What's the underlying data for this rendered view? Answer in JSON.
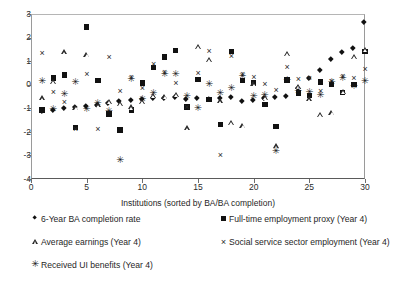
{
  "chart_data": {
    "type": "scatter",
    "title": "",
    "xlabel": "Institutions (sorted by BA/BA completion)",
    "ylabel": "",
    "xlim": [
      0,
      30
    ],
    "ylim": [
      -4,
      3
    ],
    "xticks": [
      0,
      5,
      10,
      15,
      20,
      25,
      30
    ],
    "yticks": [
      3,
      2,
      1,
      0,
      -1,
      -2,
      -3,
      -4
    ],
    "grid": false,
    "legend_position": "below-plot",
    "series": [
      {
        "name": "6-Year BA completion rate",
        "marker": "filled-diamond",
        "marker_glyph": "◆",
        "color": "#111111",
        "x": [
          1,
          2,
          3,
          4,
          5,
          6,
          7,
          8,
          9,
          10,
          11,
          12,
          13,
          14,
          15,
          16,
          17,
          18,
          19,
          20,
          21,
          22,
          23,
          24,
          25,
          26,
          27,
          28,
          29,
          30
        ],
        "y": [
          -1.12,
          -1.08,
          -1.0,
          -0.97,
          -0.92,
          -0.88,
          -0.82,
          -0.72,
          -0.68,
          -0.62,
          -0.58,
          -0.57,
          -0.55,
          -0.62,
          -0.6,
          -0.62,
          -0.58,
          -0.55,
          -0.72,
          -0.68,
          -0.6,
          -0.55,
          -0.5,
          -0.18,
          0.28,
          0.62,
          1.08,
          1.35,
          1.52,
          2.62
        ]
      },
      {
        "name": "Full-time employment proxy (Year 4)",
        "marker": "filled-square",
        "marker_glyph": "■",
        "color": "#111111",
        "x": [
          1,
          2,
          3,
          4,
          5,
          6,
          7,
          8,
          9,
          10,
          11,
          12,
          13,
          14,
          15,
          16,
          17,
          18,
          19,
          20,
          21,
          22,
          23,
          24,
          25,
          26,
          27,
          28,
          29,
          30
        ],
        "y": [
          -1.08,
          0.28,
          0.42,
          -1.82,
          2.45,
          0.18,
          -1.25,
          -1.92,
          -1.08,
          0.08,
          0.72,
          1.18,
          1.45,
          -0.95,
          0.22,
          -0.62,
          -1.68,
          1.42,
          0.18,
          0.08,
          -0.85,
          -1.78,
          0.2,
          -0.35,
          -0.45,
          0.12,
          0.02,
          -0.32,
          0.02,
          1.42
        ]
      },
      {
        "name": "Average earnings (Year 4)",
        "marker": "open-triangle",
        "marker_glyph": "△",
        "color": "#2b2b2b",
        "x": [
          1,
          2,
          3,
          4,
          5,
          6,
          7,
          8,
          9,
          10,
          11,
          12,
          13,
          14,
          15,
          16,
          17,
          18,
          19,
          20,
          21,
          22,
          23,
          24,
          25,
          26,
          27,
          28,
          29,
          30
        ],
        "y": [
          -0.58,
          0.12,
          1.38,
          -0.98,
          1.28,
          -0.88,
          -0.72,
          -0.82,
          -0.95,
          -0.72,
          -0.48,
          -0.52,
          -0.42,
          -1.85,
          1.62,
          1.05,
          -0.7,
          -1.62,
          -1.75,
          0.02,
          -0.55,
          -2.62,
          1.32,
          -0.08,
          -0.62,
          -1.28,
          -1.18,
          -0.3,
          1.18,
          1.48
        ]
      },
      {
        "name": "Social service sector employment (Year 4)",
        "marker": "thin-cross",
        "marker_glyph": "×",
        "color": "#2a2a2a",
        "x": [
          1,
          2,
          3,
          4,
          5,
          6,
          7,
          8,
          9,
          10,
          11,
          12,
          13,
          14,
          15,
          16,
          17,
          18,
          19,
          20,
          21,
          22,
          23,
          24,
          25,
          26,
          27,
          28,
          29,
          30
        ],
        "y": [
          1.28,
          -0.38,
          -0.78,
          -1.92,
          0.38,
          -1.95,
          1.12,
          -0.32,
          0.28,
          -0.18,
          0.82,
          0.48,
          0.02,
          -1.02,
          0.42,
          1.38,
          -3.02,
          1.18,
          0.38,
          0.25,
          -0.02,
          -0.28,
          0.68,
          0.18,
          0.22,
          -0.32,
          0.08,
          0.32,
          0.22,
          0.62
        ]
      },
      {
        "name": "Received UI benefits (Year 4)",
        "marker": "bold-star",
        "marker_glyph": "✳",
        "color": "#151515",
        "x": [
          1,
          2,
          3,
          4,
          5,
          6,
          7,
          8,
          9,
          10,
          11,
          12,
          13,
          14,
          15,
          16,
          17,
          18,
          19,
          20,
          21,
          22,
          23,
          24,
          25,
          26,
          27,
          28,
          29,
          30
        ],
        "y": [
          0.12,
          -1.05,
          -0.42,
          0.08,
          -1.05,
          -0.82,
          -1.12,
          -3.22,
          0.22,
          -0.62,
          -0.38,
          0.42,
          0.45,
          -0.52,
          -1.02,
          0.02,
          -0.38,
          -0.18,
          0.35,
          -0.52,
          -0.48,
          -2.82,
          0.18,
          -0.28,
          -0.35,
          -0.48,
          0.1,
          0.28,
          -0.1,
          0.15
        ]
      }
    ]
  },
  "legend": {
    "entries": [
      {
        "label": "6-Year BA completion rate",
        "marker": "filled-diamond"
      },
      {
        "label": "Full-time employment proxy (Year 4)",
        "marker": "filled-square"
      },
      {
        "label": "Average earnings (Year 4)",
        "marker": "open-triangle"
      },
      {
        "label": "Social service sector employment (Year 4)",
        "marker": "thin-cross"
      },
      {
        "label": "Received UI benefits (Year 4)",
        "marker": "bold-star"
      }
    ]
  }
}
